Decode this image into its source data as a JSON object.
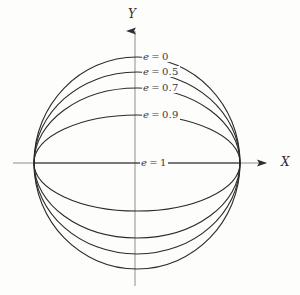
{
  "figure": {
    "background_color": "#fdfdfc",
    "curve_color": "#2b2b2b",
    "axis_color": "#8a8a8a",
    "text_color": "#3a3a3a"
  },
  "axes": {
    "x_axis_label": "X",
    "y_axis_label": "Y",
    "origin_x_px": 135,
    "origin_y_px": 163
  },
  "labels": {
    "e0": {
      "var": "e",
      "eq": "=",
      "value": "0",
      "full": "e = 0"
    },
    "e05": {
      "var": "e",
      "eq": "=",
      "value": "0.5",
      "full": "e = 0.5"
    },
    "e07": {
      "var": "e",
      "eq": "=",
      "value": "0.7",
      "full": "e = 0.7"
    },
    "e09": {
      "var": "e",
      "eq": "=",
      "value": "0.9",
      "full": "e = 0.9"
    },
    "e1": {
      "var": "e",
      "eq": "=",
      "value": "1",
      "full": "e = 1"
    }
  },
  "chart_data": {
    "type": "line",
    "title": "",
    "subtitle": "",
    "xlabel": "X",
    "ylabel": "Y",
    "grid": false,
    "legend_position": "inline-annotations",
    "xlim": [
      -1.0,
      1.0
    ],
    "ylim": [
      -1.0,
      1.0
    ],
    "common_vertex_left_px": 34,
    "common_vertex_right_px": 240,
    "series": [
      {
        "name": "e = 0",
        "eccentricity": 0,
        "semi_minor_ratio": 1.0,
        "apex_y_px_top": 57,
        "apex_y_px_bottom": 269,
        "annotation": "e = 0"
      },
      {
        "name": "e = 0.5",
        "eccentricity": 0.5,
        "semi_minor_ratio": 0.866,
        "apex_y_px_top": 72,
        "apex_y_px_bottom": 254,
        "annotation": "e = 0.5"
      },
      {
        "name": "e = 0.7",
        "eccentricity": 0.7,
        "semi_minor_ratio": 0.714,
        "apex_y_px_top": 88,
        "apex_y_px_bottom": 238,
        "annotation": "e = 0.7"
      },
      {
        "name": "e = 0.9",
        "eccentricity": 0.9,
        "semi_minor_ratio": 0.436,
        "apex_y_px_top": 115,
        "apex_y_px_bottom": 211,
        "annotation": "e = 0.9"
      },
      {
        "name": "e = 1",
        "eccentricity": 1,
        "semi_minor_ratio": 0.0,
        "apex_y_px_top": 163,
        "apex_y_px_bottom": 163,
        "annotation": "e = 1"
      }
    ]
  }
}
